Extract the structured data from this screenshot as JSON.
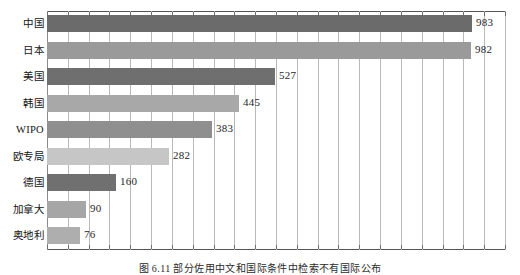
{
  "chart_data": {
    "type": "bar",
    "orientation": "horizontal",
    "title": "",
    "subtitle": "",
    "xlabel": "",
    "ylabel": "",
    "categories": [
      "中国",
      "日本",
      "美国",
      "韩国",
      "WIPO",
      "欧专局",
      "德国",
      "加拿大",
      "奥地利"
    ],
    "values": [
      983,
      982,
      527,
      445,
      383,
      282,
      160,
      90,
      76
    ],
    "value_labels": [
      "983",
      "982",
      "527",
      "445",
      "383",
      "282",
      "160",
      "90",
      "76"
    ],
    "bar_colors": [
      "#6b6b6b",
      "#9a9a9a",
      "#6f6f6f",
      "#a8a8a8",
      "#8f8f8f",
      "#c6c6c6",
      "#707070",
      "#a6a6a6",
      "#aeaeae"
    ],
    "xlim": [
      0,
      1060
    ],
    "ylim": [
      0,
      9
    ],
    "grid": true,
    "grid_axis": "x",
    "grid_interval": 50,
    "grid_count": 22,
    "legend": "none",
    "tick_labels_x": [],
    "tick_labels_y": [
      "中国",
      "日本",
      "美国",
      "韩国",
      "WIPO",
      "欧专局",
      "德国",
      "加拿大",
      "奥地利"
    ],
    "annotations": []
  },
  "figure": {
    "caption": "图 6.11   部分佐用中文和国际条件中检索不有国际公布",
    "caption_clipped": true
  },
  "colors": {
    "grid": "#b9b9b9",
    "frame": "#555555",
    "text": "#1a1a1a",
    "background": "#ffffff"
  }
}
